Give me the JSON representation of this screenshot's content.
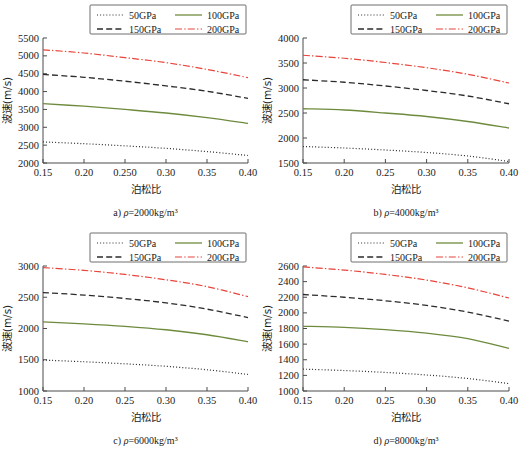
{
  "figure": {
    "xlabel": "泊松比",
    "ylabel": "波速(m/s)",
    "legend": [
      {
        "label": "50GPa",
        "style": "dotted",
        "color": "#2b2b2b"
      },
      {
        "label": "100GPa",
        "style": "solid",
        "color": "#6E8B3D"
      },
      {
        "label": "150GPa",
        "style": "dashed",
        "color": "#2b2b2b"
      },
      {
        "label": "200GPa",
        "style": "dashdot",
        "color": "#E8443A"
      }
    ]
  },
  "chart_data": [
    {
      "type": "line",
      "panel": "a",
      "caption_prefix": "a) ",
      "caption_rho": "ρ",
      "caption_suffix": "=2000kg/m³",
      "title": "",
      "xlabel": "泊松比",
      "ylabel": "波速(m/s)",
      "xlim": [
        0.15,
        0.4
      ],
      "ylim": [
        2000,
        5500
      ],
      "yticks": [
        2000,
        2500,
        3000,
        3500,
        4000,
        4500,
        5000,
        5500
      ],
      "xticks": [
        0.15,
        0.2,
        0.25,
        0.3,
        0.35,
        0.4
      ],
      "xticklabels": [
        "0.15",
        "0.20",
        "0.250",
        "0.30",
        "0.35",
        "0.40"
      ],
      "grid": false,
      "legend_position": "top",
      "x": [
        0.15,
        0.2,
        0.25,
        0.3,
        0.35,
        0.4
      ],
      "series": [
        {
          "name": "50GPa",
          "values": [
            2590,
            2540,
            2480,
            2410,
            2320,
            2210
          ]
        },
        {
          "name": "100GPa",
          "values": [
            3660,
            3590,
            3500,
            3400,
            3270,
            3110
          ]
        },
        {
          "name": "150GPa",
          "values": [
            4480,
            4400,
            4290,
            4160,
            4010,
            3810
          ]
        },
        {
          "name": "200GPa",
          "values": [
            5170,
            5080,
            4950,
            4810,
            4620,
            4390
          ]
        }
      ]
    },
    {
      "type": "line",
      "panel": "b",
      "caption_prefix": "b) ",
      "caption_rho": "ρ",
      "caption_suffix": "=4000kg/m³",
      "title": "",
      "xlabel": "泊松比",
      "ylabel": "波速(m/s)",
      "xlim": [
        0.15,
        0.4
      ],
      "ylim": [
        1500,
        4000
      ],
      "yticks": [
        1500,
        2000,
        2500,
        3000,
        3500,
        4000
      ],
      "xticks": [
        0.15,
        0.2,
        0.25,
        0.3,
        0.35,
        0.4
      ],
      "xticklabels": [
        "0.15",
        "0.20",
        "0.25",
        "0.30",
        "0.35",
        "0.40"
      ],
      "grid": false,
      "legend_position": "top",
      "x": [
        0.15,
        0.2,
        0.25,
        0.3,
        0.35,
        0.4
      ],
      "series": [
        {
          "name": "50GPa",
          "values": [
            1830,
            1800,
            1760,
            1710,
            1640,
            1530
          ]
        },
        {
          "name": "100GPa",
          "values": [
            2585,
            2560,
            2500,
            2430,
            2330,
            2200
          ]
        },
        {
          "name": "150GPa",
          "values": [
            3165,
            3115,
            3040,
            2950,
            2840,
            2685
          ]
        },
        {
          "name": "200GPa",
          "values": [
            3655,
            3595,
            3510,
            3405,
            3275,
            3100
          ]
        }
      ]
    },
    {
      "type": "line",
      "panel": "c",
      "caption_prefix": "c) ",
      "caption_rho": "ρ",
      "caption_suffix": "=6000kg/m³",
      "title": "",
      "xlabel": "泊松比",
      "ylabel": "波速(m/s)",
      "xlim": [
        0.15,
        0.4
      ],
      "ylim": [
        1000,
        3000
      ],
      "yticks": [
        1000,
        1500,
        2000,
        2500,
        3000
      ],
      "xticks": [
        0.15,
        0.2,
        0.25,
        0.3,
        0.35,
        0.4
      ],
      "xticklabels": [
        "0.15",
        "0.20",
        "0.25",
        "0.30",
        "0.35",
        "0.40"
      ],
      "grid": false,
      "legend_position": "top",
      "x": [
        0.15,
        0.2,
        0.25,
        0.3,
        0.35,
        0.4
      ],
      "series": [
        {
          "name": "50GPa",
          "values": [
            1495,
            1468,
            1435,
            1395,
            1340,
            1265
          ]
        },
        {
          "name": "100GPa",
          "values": [
            2105,
            2075,
            2035,
            1980,
            1900,
            1790
          ]
        },
        {
          "name": "150GPa",
          "values": [
            2575,
            2535,
            2480,
            2410,
            2310,
            2175
          ]
        },
        {
          "name": "200GPa",
          "values": [
            2975,
            2930,
            2865,
            2780,
            2670,
            2510
          ]
        }
      ]
    },
    {
      "type": "line",
      "panel": "d",
      "caption_prefix": "d) ",
      "caption_rho": "ρ",
      "caption_suffix": "=8000kg/m³",
      "title": "",
      "xlabel": "泊松比",
      "ylabel": "波速(m/s)",
      "xlim": [
        0.15,
        0.4
      ],
      "ylim": [
        1000,
        2600
      ],
      "yticks": [
        1000,
        1200,
        1400,
        1600,
        1800,
        2000,
        2200,
        2400,
        2600
      ],
      "xticks": [
        0.15,
        0.2,
        0.25,
        0.3,
        0.35,
        0.4
      ],
      "xticklabels": [
        "0.15",
        "0.20",
        "0.25",
        "0.30",
        "0.35",
        "0.40"
      ],
      "grid": false,
      "legend_position": "top",
      "x": [
        0.15,
        0.2,
        0.25,
        0.3,
        0.35,
        0.4
      ],
      "series": [
        {
          "name": "50GPa",
          "values": [
            1280,
            1262,
            1238,
            1205,
            1160,
            1095
          ]
        },
        {
          "name": "100GPa",
          "values": [
            1828,
            1815,
            1785,
            1740,
            1670,
            1545
          ]
        },
        {
          "name": "150GPa",
          "values": [
            2235,
            2200,
            2155,
            2095,
            2010,
            1895
          ]
        },
        {
          "name": "200GPa",
          "values": [
            2588,
            2548,
            2492,
            2420,
            2320,
            2190
          ]
        }
      ]
    }
  ]
}
